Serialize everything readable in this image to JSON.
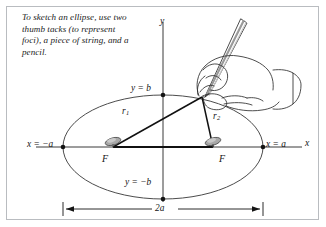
{
  "caption": {
    "text": "To sketch an ellipse, use two thumb tacks (to represent foci), a piece of string, and a pencil."
  },
  "figure": {
    "labels": {
      "y_axis": "y",
      "x_axis": "x",
      "top_vertex": "y = b",
      "bottom_vertex": "y = −b",
      "left_vertex": "x = −a",
      "right_vertex": "x = a",
      "focus_left": "F",
      "focus_right": "F",
      "radius_1_base": "r",
      "radius_1_sub": "1",
      "radius_2_base": "r",
      "radius_2_sub": "2",
      "major_axis_dimension": "2a"
    },
    "colors": {
      "ink": "#141414",
      "ellipse_stroke": "#4c4c4c",
      "axis_stroke": "#3a3a3a",
      "string_stroke": "#111111",
      "tack_fill": "#a8a8a8",
      "tack_stroke": "#4a4a4a",
      "pencil_body": "#d8d8d8",
      "hand_stroke": "#2e2e2e",
      "frame_border": "#b9bcc0",
      "page_background": "#ffffff"
    },
    "geometry": {
      "center_x": 163,
      "center_y": 147,
      "semi_major_a": 100,
      "semi_minor_b": 52,
      "focus_left_x": 113,
      "focus_right_x": 213,
      "pencil_tip_x": 202,
      "pencil_tip_y": 97,
      "dimension_line_y": 209
    }
  }
}
